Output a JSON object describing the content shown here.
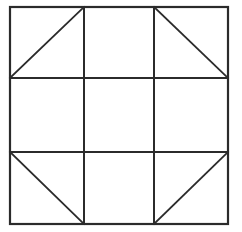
{
  "figure": {
    "type": "geometric-line-diagram",
    "background_color": "#ffffff",
    "line_color": "#2b2b2b",
    "canvas": {
      "width": 242,
      "height": 232
    },
    "outer_square": {
      "name": "outer-border",
      "left": 10,
      "top": 7,
      "right": 228,
      "bottom": 224,
      "stroke_width": 2.2
    },
    "grid": {
      "rows": 3,
      "columns": 3,
      "vertical_line_x": [
        84,
        154
      ],
      "horizontal_line_y": [
        78,
        152
      ],
      "stroke_width": 2.0
    },
    "cells": [
      {
        "name": "cell-top-left",
        "row": 0,
        "col": 0,
        "x0": 10,
        "y0": 7,
        "x1": 84,
        "y1": 78,
        "diagonal": "anti",
        "filled": false
      },
      {
        "name": "cell-top-center",
        "row": 0,
        "col": 1,
        "x0": 84,
        "y0": 7,
        "x1": 154,
        "y1": 78,
        "diagonal": "none",
        "filled": false
      },
      {
        "name": "cell-top-right",
        "row": 0,
        "col": 2,
        "x0": 154,
        "y0": 7,
        "x1": 228,
        "y1": 78,
        "diagonal": "main",
        "filled": false
      },
      {
        "name": "cell-middle-left",
        "row": 1,
        "col": 0,
        "x0": 10,
        "y0": 78,
        "x1": 84,
        "y1": 152,
        "diagonal": "none",
        "filled": false
      },
      {
        "name": "cell-middle-center",
        "row": 1,
        "col": 1,
        "x0": 84,
        "y0": 78,
        "x1": 154,
        "y1": 152,
        "diagonal": "none",
        "filled": false
      },
      {
        "name": "cell-middle-right",
        "row": 1,
        "col": 2,
        "x0": 154,
        "y0": 78,
        "x1": 228,
        "y1": 152,
        "diagonal": "none",
        "filled": false
      },
      {
        "name": "cell-bottom-left",
        "row": 2,
        "col": 0,
        "x0": 10,
        "y0": 152,
        "x1": 84,
        "y1": 224,
        "diagonal": "main",
        "filled": false
      },
      {
        "name": "cell-bottom-center",
        "row": 2,
        "col": 1,
        "x0": 84,
        "y0": 152,
        "x1": 154,
        "y1": 224,
        "diagonal": "none",
        "filled": false
      },
      {
        "name": "cell-bottom-right",
        "row": 2,
        "col": 2,
        "x0": 154,
        "y0": 152,
        "x1": 228,
        "y1": 224,
        "diagonal": "anti",
        "filled": false
      }
    ],
    "diagonals": [
      {
        "name": "diagonal-top-left",
        "x1": 10,
        "y1": 78,
        "x2": 84,
        "y2": 7,
        "stroke_width": 1.8
      },
      {
        "name": "diagonal-top-right",
        "x1": 154,
        "y1": 7,
        "x2": 228,
        "y2": 78,
        "stroke_width": 1.8
      },
      {
        "name": "diagonal-bottom-left",
        "x1": 10,
        "y1": 152,
        "x2": 84,
        "y2": 224,
        "stroke_width": 1.8
      },
      {
        "name": "diagonal-bottom-right",
        "x1": 154,
        "y1": 224,
        "x2": 228,
        "y2": 152,
        "stroke_width": 1.8
      }
    ],
    "labels": [],
    "annotations": []
  }
}
